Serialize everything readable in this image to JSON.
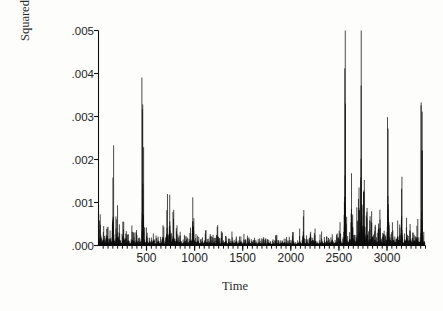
{
  "chart_data": {
    "type": "line",
    "style": "vertical-spike-series",
    "title": "",
    "subtitle": "",
    "xlabel": "Time",
    "ylabel": "Squared Return",
    "grid": false,
    "legend": null,
    "xlim": [
      1,
      3400
    ],
    "ylim": [
      0.0,
      0.005
    ],
    "ytick_labels": [
      ".005",
      ".004",
      ".003",
      ".002",
      ".001",
      ".000"
    ],
    "ytick_values": [
      0.005,
      0.004,
      0.003,
      0.002,
      0.001,
      0.0
    ],
    "xtick_labels": [
      "500",
      "1000",
      "1500",
      "2000",
      "2500",
      "3000"
    ],
    "xtick_values": [
      500,
      1000,
      1500,
      2000,
      2500,
      3000
    ],
    "xminor_step": 50,
    "series_color": "#101010",
    "baseline": 0.0,
    "notable_spikes": [
      {
        "x": 460,
        "y": 0.00328
      },
      {
        "x": 2498,
        "y": 0.00412
      },
      {
        "x": 2668,
        "y": 0.00372
      },
      {
        "x": 2958,
        "y": 0.00272
      },
      {
        "x": 3348,
        "y": 0.00222
      },
      {
        "x": 160,
        "y": 0.00158
      },
      {
        "x": 745,
        "y": 0.00118
      },
      {
        "x": 1000,
        "y": 0.00112
      },
      {
        "x": 2565,
        "y": 0.00168
      },
      {
        "x": 3160,
        "y": 0.00132
      }
    ],
    "x": [
      1,
      11,
      21,
      31,
      41,
      51,
      61,
      71,
      81,
      91,
      101,
      111,
      121,
      131,
      141,
      151,
      161,
      171,
      181,
      191,
      201,
      211,
      221,
      231,
      241,
      251,
      261,
      271,
      281,
      291,
      301,
      311,
      321,
      331,
      341,
      351,
      361,
      371,
      381,
      391,
      401,
      411,
      421,
      431,
      441,
      451,
      461,
      471,
      481,
      491,
      501,
      511,
      521,
      531,
      541,
      551,
      561,
      571,
      581,
      591,
      601,
      611,
      621,
      631,
      641,
      651,
      661,
      671,
      681,
      691,
      701,
      711,
      721,
      731,
      741,
      751,
      761,
      771,
      781,
      791,
      801,
      811,
      821,
      831,
      841,
      851,
      861,
      871,
      881,
      891,
      901,
      911,
      921,
      931,
      941,
      951,
      961,
      971,
      981,
      991,
      1001,
      1011,
      1021,
      1031,
      1041,
      1051,
      1061,
      1071,
      1081,
      1091,
      1101,
      1111,
      1121,
      1131,
      1141,
      1151,
      1161,
      1171,
      1181,
      1191,
      1201,
      1211,
      1221,
      1231,
      1241,
      1251,
      1261,
      1271,
      1281,
      1291,
      1301,
      1311,
      1321,
      1331,
      1341,
      1351,
      1361,
      1371,
      1381,
      1391,
      1401,
      1411,
      1421,
      1431,
      1441,
      1451,
      1461,
      1471,
      1481,
      1491,
      1501,
      1511,
      1521,
      1531,
      1541,
      1551,
      1561,
      1571,
      1581,
      1591,
      1601,
      1611,
      1621,
      1631,
      1641,
      1651,
      1661,
      1671,
      1681,
      1691,
      1701,
      1711,
      1721,
      1731,
      1741,
      1751,
      1761,
      1771,
      1781,
      1791,
      1801,
      1811,
      1821,
      1831,
      1841,
      1851,
      1861,
      1871,
      1881,
      1891,
      1901,
      1911,
      1921,
      1931,
      1941,
      1951,
      1961,
      1971,
      1981,
      1991,
      2001,
      2011,
      2021,
      2031,
      2041,
      2051,
      2061,
      2071,
      2081,
      2091,
      2101,
      2111,
      2121,
      2131,
      2141,
      2151,
      2161,
      2171,
      2181,
      2191,
      2201,
      2211,
      2221,
      2231,
      2241,
      2251,
      2261,
      2271,
      2281,
      2291,
      2301,
      2311,
      2321,
      2331,
      2341,
      2351,
      2361,
      2371,
      2381,
      2391,
      2401,
      2411,
      2421,
      2431,
      2441,
      2451,
      2461,
      2471,
      2481,
      2491,
      2501,
      2511,
      2521,
      2531,
      2541,
      2551,
      2561,
      2571,
      2581,
      2591,
      2601,
      2611,
      2621,
      2631,
      2641,
      2651,
      2661,
      2671,
      2681,
      2691,
      2701,
      2711,
      2721,
      2731,
      2741,
      2751,
      2761,
      2771,
      2781,
      2791,
      2801,
      2811,
      2821,
      2831,
      2841,
      2851,
      2861,
      2871,
      2881,
      2891,
      2901,
      2911,
      2921,
      2931,
      2941,
      2951,
      2961,
      2971,
      2981,
      2991,
      3001,
      3011,
      3021,
      3031,
      3041,
      3051,
      3061,
      3071,
      3081,
      3091,
      3101,
      3111,
      3121,
      3131,
      3141,
      3151,
      3161,
      3171,
      3181,
      3191,
      3201,
      3211,
      3221,
      3231,
      3241,
      3251,
      3261,
      3271,
      3281,
      3291,
      3301,
      3311,
      3321,
      3331,
      3341,
      3351,
      3361,
      3371,
      3381,
      3391
    ],
    "y": [
      0.00022,
      0.00014,
      0.00048,
      0.00018,
      9e-05,
      0.00031,
      0.00012,
      6e-05,
      0.00024,
      0.00042,
      0.00016,
      8e-05,
      0.00035,
      0.00011,
      0.00019,
      0.00158,
      0.00026,
      9e-05,
      0.00014,
      0.00061,
      0.00018,
      7e-05,
      0.00029,
      0.00012,
      5e-05,
      0.00022,
      0.00038,
      0.00013,
      7e-05,
      0.00017,
      9e-05,
      0.00026,
      0.00011,
      6e-05,
      0.00014,
      0.00032,
      8e-05,
      0.00019,
      7e-05,
      0.00012,
      0.00024,
      9e-05,
      5e-05,
      0.00016,
      0.00011,
      7e-05,
      0.00328,
      0.00031,
      0.00014,
      8e-05,
      0.00022,
      0.0001,
      6e-05,
      0.00018,
      9e-05,
      0.00013,
      7e-05,
      0.00028,
      0.00011,
      5e-05,
      0.00016,
      8e-05,
      0.00021,
      0.0001,
      6e-05,
      0.00014,
      9e-05,
      0.00047,
      0.00012,
      7e-05,
      0.00019,
      0.00082,
      0.00011,
      6e-05,
      0.00118,
      0.00026,
      9e-05,
      0.00015,
      0.00062,
      0.00011,
      7e-05,
      0.00033,
      0.00012,
      0.00018,
      8e-05,
      0.00024,
      0.0001,
      6e-05,
      0.00014,
      9e-05,
      0.00021,
      0.00011,
      7e-05,
      0.00016,
      8e-05,
      0.00029,
      0.00012,
      6e-05,
      0.00112,
      0.00034,
      0.0001,
      0.00017,
      8e-05,
      0.00023,
      0.00011,
      6e-05,
      0.00014,
      9e-05,
      0.00019,
      7e-05,
      0.00012,
      0.00026,
      8e-05,
      0.00015,
      0.0001,
      6e-05,
      0.00021,
      9e-05,
      0.00013,
      7e-05,
      0.00017,
      0.00011,
      5e-05,
      0.00024,
      8e-05,
      0.00014,
      0.0001,
      6e-05,
      0.00018,
      9e-05,
      0.00012,
      7e-05,
      0.00022,
      0.0001,
      5e-05,
      0.00015,
      8e-05,
      0.00011,
      6e-05,
      0.00019,
      9e-05,
      0.00013,
      7e-05,
      0.00016,
      0.0001,
      5e-05,
      0.00012,
      8e-05,
      0.00021,
      9e-05,
      6e-05,
      0.00014,
      7e-05,
      0.00011,
      5e-05,
      0.00017,
      9e-05,
      0.00012,
      6e-05,
      0.0001,
      8e-05,
      4e-05,
      0.00013,
      7e-05,
      9e-05,
      5e-05,
      0.00015,
      8e-05,
      0.00011,
      6e-05,
      9e-05,
      4e-05,
      0.00012,
      7e-05,
      0.0001,
      5e-05,
      8e-05,
      0.00013,
      6e-05,
      9e-05,
      4e-05,
      0.00011,
      7e-05,
      5e-05,
      0.0001,
      0.00014,
      6e-05,
      8e-05,
      4e-05,
      0.00012,
      7e-05,
      9e-05,
      5e-05,
      0.00016,
      8e-05,
      6e-05,
      0.00011,
      4e-05,
      9e-05,
      0.00013,
      7e-05,
      5e-05,
      0.00018,
      0.0001,
      6e-05,
      8e-05,
      4e-05,
      0.00012,
      7e-05,
      0.00022,
      9e-05,
      5e-05,
      0.00011,
      0.00068,
      8e-05,
      6e-05,
      0.00014,
      9e-05,
      5e-05,
      0.00012,
      7e-05,
      0.00019,
      0.0001,
      6e-05,
      8e-05,
      0.00024,
      0.00011,
      7e-05,
      9e-05,
      5e-05,
      0.00013,
      8e-05,
      0.00016,
      0.0001,
      6e-05,
      0.00012,
      7e-05,
      0.00021,
      9e-05,
      5e-05,
      0.00014,
      8e-05,
      0.00011,
      0.00026,
      9e-05,
      6e-05,
      0.00013,
      8e-05,
      0.00017,
      0.0001,
      6e-05,
      0.00029,
      0.00011,
      7e-05,
      0.00015,
      9e-05,
      0.00412,
      0.00038,
      0.00014,
      0.00022,
      9e-05,
      0.00031,
      0.00012,
      0.00168,
      0.00043,
      0.00016,
      0.00025,
      0.0001,
      0.00019,
      0.00056,
      0.00013,
      0.00082,
      0.00022,
      0.00372,
      0.00095,
      0.00031,
      0.00128,
      0.00042,
      0.00018,
      0.00064,
      0.00024,
      0.00011,
      0.00037,
      0.00015,
      0.00052,
      0.00021,
      9e-05,
      0.00033,
      0.00013,
      0.00019,
      8e-05,
      0.00027,
      0.00011,
      0.00041,
      0.00016,
      7e-05,
      0.00022,
      0.0001,
      0.00014,
      6e-05,
      0.00031,
      0.00272,
      0.00048,
      0.00018,
      0.00026,
      0.0001,
      0.00035,
      0.00013,
      0.00021,
      8e-05,
      0.00016,
      0.00058,
      0.00012,
      0.00024,
      9e-05,
      0.00132,
      0.00019,
      7e-05,
      0.00028,
      0.00011,
      0.00042,
      0.00015,
      0.00022,
      9e-05,
      0.00033,
      0.00012,
      0.00017,
      7e-05,
      0.00025,
      0.0001,
      0.00014,
      0.00046,
      0.00011,
      0.00019,
      8e-05,
      0.00029,
      0.00222,
      0.00016,
      9e-05,
      0.00021,
      7e-05
    ]
  }
}
